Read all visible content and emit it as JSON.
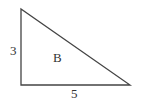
{
  "diagram": {
    "type": "right-triangle",
    "shape_label": "B",
    "sides": [
      {
        "name": "vertical-leg",
        "label": "3"
      },
      {
        "name": "horizontal-leg",
        "label": "5"
      }
    ],
    "vertices": [
      [
        21,
        9
      ],
      [
        21,
        85
      ],
      [
        130,
        85
      ]
    ],
    "stroke_color": "#444444"
  }
}
